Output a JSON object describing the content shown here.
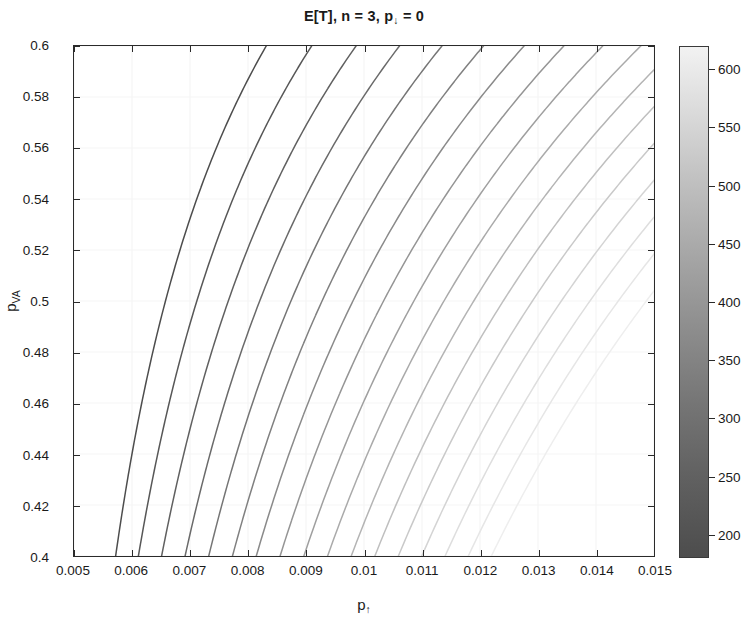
{
  "chart_data": {
    "type": "line",
    "subtype": "contour",
    "title_parts": {
      "prefix": "E[T], n = 3, p",
      "subscript": "↓",
      "suffix": " = 0"
    },
    "xlabel": "p↑",
    "xlabel_parts": {
      "base": "p",
      "subscript": "↑"
    },
    "ylabel": "p_VA",
    "ylabel_parts": {
      "base": "p",
      "subscript": "VA"
    },
    "xlim": [
      0.005,
      0.015
    ],
    "ylim": [
      0.4,
      0.6
    ],
    "xticks": [
      0.005,
      0.006,
      0.007,
      0.008,
      0.009,
      0.01,
      0.011,
      0.012,
      0.013,
      0.014,
      0.015
    ],
    "xticklabels": [
      "0.005",
      "0.006",
      "0.007",
      "0.008",
      "0.009",
      "0.01",
      "0.011",
      "0.012",
      "0.013",
      "0.014",
      "0.015"
    ],
    "yticks": [
      0.4,
      0.42,
      0.44,
      0.46,
      0.48,
      0.5,
      0.52,
      0.54,
      0.56,
      0.58,
      0.6
    ],
    "yticklabels": [
      "0.4",
      "0.42",
      "0.44",
      "0.46",
      "0.48",
      "0.5",
      "0.52",
      "0.54",
      "0.56",
      "0.58",
      "0.6"
    ],
    "grid": true,
    "legend": false,
    "colorbar": {
      "orientation": "vertical",
      "colormap": "gray",
      "vmin": 180,
      "vmax": 620,
      "ticks": [
        200,
        250,
        300,
        350,
        400,
        450,
        500,
        550,
        600
      ],
      "ticklabels": [
        "200",
        "250",
        "300",
        "350",
        "400",
        "450",
        "500",
        "550",
        "600"
      ]
    },
    "contour_levels": [
      200,
      225,
      250,
      275,
      300,
      325,
      350,
      375,
      400,
      425,
      450,
      475,
      500,
      525,
      550,
      575,
      600
    ],
    "contour_colors": [
      "#4d4d4d",
      "#575757",
      "#606060",
      "#6a6a6a",
      "#757575",
      "#808080",
      "#8a8a8a",
      "#959595",
      "#9f9f9f",
      "#aaaaaa",
      "#b4b4b4",
      "#bfbfbf",
      "#c9c9c9",
      "#d4d4d4",
      "#dedede",
      "#e6e6e6",
      "#eeeeee"
    ]
  }
}
